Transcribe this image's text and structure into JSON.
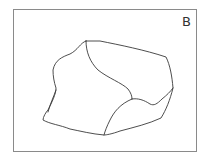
{
  "figure": {
    "panel_label": "B",
    "line_color": "#3a3a3a",
    "frame_color": "#8a8a8a"
  }
}
